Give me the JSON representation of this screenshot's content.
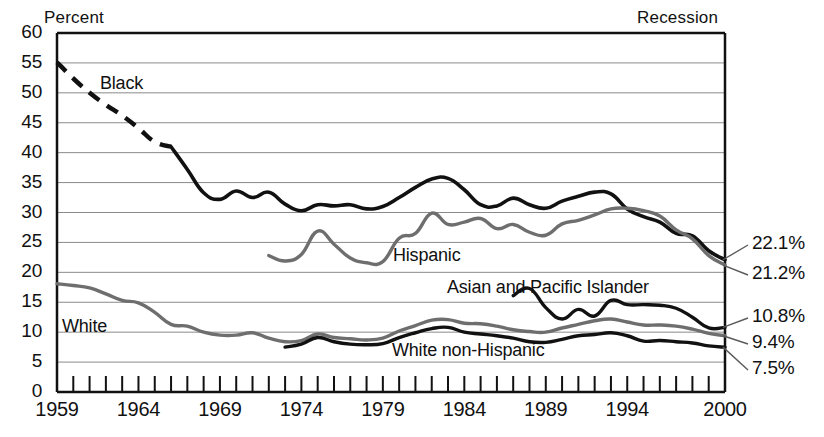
{
  "chart_data": {
    "type": "line",
    "title": "",
    "ylabel": "Percent",
    "xlabel": "",
    "corner_note": "Recession",
    "ylim": [
      0,
      60
    ],
    "xlim": [
      1959,
      2000
    ],
    "yticks": [
      60,
      55,
      50,
      45,
      40,
      35,
      30,
      25,
      20,
      15,
      10,
      5,
      0
    ],
    "xticks_labeled": [
      1959,
      1964,
      1969,
      1974,
      1979,
      1984,
      1989,
      1994,
      2000
    ],
    "xtick_interval_years": 1,
    "grid": "horizontal",
    "legend": "inline-labels",
    "colors": {
      "black": "#111111",
      "gray": "#6e6e6e",
      "grid": "#8a8a8a",
      "axis": "#111111"
    },
    "series": [
      {
        "name": "Black",
        "label": "Black",
        "color": "#111111",
        "dashed_until": 1966,
        "x": [
          1959,
          1960,
          1961,
          1962,
          1963,
          1964,
          1965,
          1966,
          1967,
          1968,
          1969,
          1970,
          1971,
          1972,
          1973,
          1974,
          1975,
          1976,
          1977,
          1978,
          1979,
          1980,
          1981,
          1982,
          1983,
          1984,
          1985,
          1986,
          1987,
          1988,
          1989,
          1990,
          1991,
          1992,
          1993,
          1994,
          1995,
          1996,
          1997,
          1998,
          1999,
          2000
        ],
        "y": [
          55.1,
          52.4,
          50.0,
          48.0,
          46.2,
          44.1,
          41.8,
          41.0,
          37.2,
          33.3,
          32.2,
          33.6,
          32.5,
          33.4,
          31.4,
          30.3,
          31.3,
          31.1,
          31.3,
          30.6,
          31.0,
          32.5,
          34.2,
          35.6,
          35.7,
          33.8,
          31.3,
          31.1,
          32.4,
          31.3,
          30.7,
          31.9,
          32.7,
          33.4,
          33.1,
          30.6,
          29.3,
          28.4,
          26.5,
          26.1,
          23.6,
          22.1
        ]
      },
      {
        "name": "White",
        "label": "White",
        "color": "#6e6e6e",
        "x": [
          1959,
          1960,
          1961,
          1962,
          1963,
          1964,
          1965,
          1966,
          1967,
          1968,
          1969,
          1970,
          1971,
          1972,
          1973,
          1974,
          1975,
          1976,
          1977,
          1978,
          1979,
          1980,
          1981,
          1982,
          1983,
          1984,
          1985,
          1986,
          1987,
          1988,
          1989,
          1990,
          1991,
          1992,
          1993,
          1994,
          1995,
          1996,
          1997,
          1998,
          1999,
          2000
        ],
        "y": [
          18.1,
          17.8,
          17.4,
          16.4,
          15.3,
          14.9,
          13.3,
          11.3,
          11.0,
          10.0,
          9.5,
          9.5,
          9.9,
          9.0,
          8.4,
          8.6,
          9.7,
          9.1,
          8.9,
          8.7,
          9.0,
          10.2,
          11.1,
          12.0,
          12.1,
          11.5,
          11.4,
          11.0,
          10.4,
          10.1,
          10.0,
          10.7,
          11.3,
          11.9,
          12.2,
          11.7,
          11.2,
          11.2,
          11.0,
          10.5,
          9.8,
          9.4
        ]
      },
      {
        "name": "Hispanic",
        "label": "Hispanic",
        "color": "#6e6e6e",
        "x": [
          1972,
          1973,
          1974,
          1975,
          1976,
          1977,
          1978,
          1979,
          1980,
          1981,
          1982,
          1983,
          1984,
          1985,
          1986,
          1987,
          1988,
          1989,
          1990,
          1991,
          1992,
          1993,
          1994,
          1995,
          1996,
          1997,
          1998,
          1999,
          2000
        ],
        "y": [
          22.8,
          21.9,
          23.0,
          26.9,
          24.7,
          22.4,
          21.6,
          21.8,
          25.7,
          26.5,
          29.9,
          28.0,
          28.4,
          29.0,
          27.3,
          28.0,
          26.7,
          26.2,
          28.1,
          28.7,
          29.6,
          30.6,
          30.7,
          30.3,
          29.4,
          27.1,
          25.6,
          22.8,
          21.2
        ]
      },
      {
        "name": "White non-Hispanic",
        "label": "White non-Hispanic",
        "color": "#111111",
        "x": [
          1973,
          1974,
          1975,
          1976,
          1977,
          1978,
          1979,
          1980,
          1981,
          1982,
          1983,
          1984,
          1985,
          1986,
          1987,
          1988,
          1989,
          1990,
          1991,
          1992,
          1993,
          1994,
          1995,
          1996,
          1997,
          1998,
          1999,
          2000
        ],
        "y": [
          7.5,
          8.0,
          9.1,
          8.4,
          8.0,
          7.9,
          8.1,
          9.1,
          9.9,
          10.6,
          10.8,
          10.0,
          9.7,
          9.4,
          9.0,
          8.4,
          8.3,
          8.8,
          9.4,
          9.6,
          9.9,
          9.4,
          8.5,
          8.6,
          8.4,
          8.2,
          7.7,
          7.5
        ]
      },
      {
        "name": "Asian and Pacific Islander",
        "label": "Asian and Pacific Islander",
        "color": "#111111",
        "x": [
          1987,
          1988,
          1989,
          1990,
          1991,
          1992,
          1993,
          1994,
          1995,
          1996,
          1997,
          1998,
          1999,
          2000
        ],
        "y": [
          16.1,
          17.3,
          14.1,
          12.2,
          13.8,
          12.7,
          15.3,
          14.6,
          14.6,
          14.5,
          14.0,
          12.5,
          10.7,
          10.8
        ]
      }
    ],
    "end_labels": [
      {
        "text": "22.1%",
        "series": "Black",
        "value": 22.1
      },
      {
        "text": "21.2%",
        "series": "Hispanic",
        "value": 21.2
      },
      {
        "text": "10.8%",
        "series": "Asian and Pacific Islander",
        "value": 10.8
      },
      {
        "text": "9.4%",
        "series": "White",
        "value": 9.4
      },
      {
        "text": "7.5%",
        "series": "White non-Hispanic",
        "value": 7.5
      }
    ],
    "inline_labels": [
      {
        "text": "Black"
      },
      {
        "text": "White"
      },
      {
        "text": "Hispanic"
      },
      {
        "text": "Asian and Pacific Islander"
      },
      {
        "text": "White non-Hispanic"
      }
    ]
  }
}
